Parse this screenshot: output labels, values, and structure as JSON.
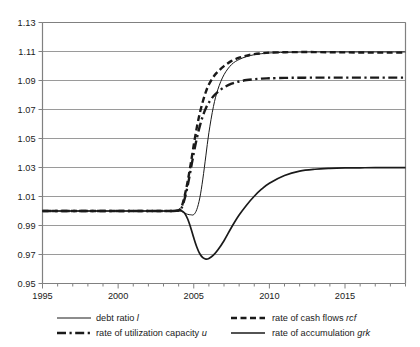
{
  "chart_data": {
    "type": "line",
    "title": "",
    "xlabel": "",
    "ylabel": "",
    "xlim": [
      1995,
      2019
    ],
    "ylim": [
      0.95,
      1.13
    ],
    "grid": "horizontal",
    "legend_position": "bottom",
    "xticks": [
      1995,
      2000,
      2005,
      2010,
      2015
    ],
    "xtick_labels": [
      "1995",
      "2000",
      "2005",
      "2010",
      "2015"
    ],
    "xminor_tick_step": 1,
    "yticks": [
      0.95,
      0.97,
      0.99,
      1.01,
      1.03,
      1.05,
      1.07,
      1.09,
      1.11,
      1.13
    ],
    "ytick_labels": [
      "0.95",
      "0.97",
      "0.99",
      "1.01",
      "1.03",
      "1.05",
      "1.07",
      "1.09",
      "1.11",
      "1.13"
    ],
    "x": [
      1995,
      1996,
      1997,
      1998,
      1999,
      2000,
      2001,
      2002,
      2003,
      2003.5,
      2004,
      2004.2,
      2004.4,
      2004.6,
      2004.8,
      2005,
      2005.2,
      2005.4,
      2005.6,
      2005.8,
      2006,
      2006.3,
      2006.6,
      2007,
      2007.5,
      2008,
      2008.5,
      2009,
      2009.5,
      2010,
      2011,
      2012,
      2013,
      2014,
      2015,
      2016,
      2017,
      2018,
      2019
    ],
    "series": [
      {
        "name": "debt ratio l",
        "symbol": "l",
        "label_prefix": "debt ratio ",
        "style": "solid-thin",
        "color": "#1a1a1a",
        "width": 1.0,
        "dash": "",
        "values": [
          1.0,
          1.0,
          1.0,
          1.0,
          1.0,
          1.0,
          1.0,
          1.0,
          1.0,
          1.0,
          1.0,
          0.9996,
          0.9986,
          0.9977,
          0.9974,
          0.9975,
          1.001,
          1.009,
          1.022,
          1.038,
          1.054,
          1.072,
          1.084,
          1.094,
          1.101,
          1.1045,
          1.1065,
          1.1078,
          1.1085,
          1.109,
          1.1094,
          1.1096,
          1.1097,
          1.1097,
          1.1097,
          1.1097,
          1.1097,
          1.1097,
          1.1097
        ]
      },
      {
        "name": "rate of cash flows rcf",
        "symbol": "rcf",
        "label_prefix": "rate of cash flows ",
        "style": "dashed-thick",
        "color": "#1a1a1a",
        "width": 2.4,
        "dash": "6,3.5",
        "values": [
          1.0,
          1.0,
          1.0,
          1.0,
          1.0,
          1.0,
          1.0,
          1.0,
          1.0,
          1.0,
          1.0005,
          1.003,
          1.0105,
          1.0205,
          1.0325,
          1.0455,
          1.0575,
          1.0675,
          1.0755,
          1.0822,
          1.0872,
          1.0925,
          1.0962,
          1.0999,
          1.1035,
          1.1057,
          1.1072,
          1.1082,
          1.1088,
          1.1092,
          1.1095,
          1.1096,
          1.1096,
          1.1095,
          1.1094,
          1.1093,
          1.1092,
          1.1092,
          1.1092
        ]
      },
      {
        "name": "rate of utilization capacity u",
        "symbol": "u",
        "label_prefix": "rate of utilization capacity ",
        "style": "dashdot-thick",
        "color": "#1a1a1a",
        "width": 2.4,
        "dash": "9,3.5,2.2,3.5",
        "values": [
          1.0,
          1.0,
          1.0,
          1.0,
          1.0,
          1.0,
          1.0,
          1.0,
          1.0,
          1.0,
          1.0003,
          1.0022,
          1.0085,
          1.0175,
          1.0285,
          1.0398,
          1.05,
          1.0585,
          1.0655,
          1.0708,
          1.0748,
          1.0792,
          1.0822,
          1.0852,
          1.0878,
          1.0893,
          1.0903,
          1.0909,
          1.0913,
          1.0915,
          1.0918,
          1.0919,
          1.092,
          1.092,
          1.092,
          1.092,
          1.092,
          1.092,
          1.092
        ]
      },
      {
        "name": "rate of accumulation grk",
        "symbol": "grk",
        "label_prefix": "rate of accumulation ",
        "style": "solid-medium",
        "color": "#1a1a1a",
        "width": 1.7,
        "dash": "",
        "values": [
          1.0,
          1.0,
          1.0,
          1.0,
          1.0,
          1.0,
          1.0,
          1.0,
          1.0,
          1.0,
          1.0005,
          1.0002,
          0.9985,
          0.9945,
          0.9885,
          0.9815,
          0.9752,
          0.9705,
          0.9678,
          0.9668,
          0.9672,
          0.9695,
          0.9732,
          0.9795,
          0.9888,
          0.9972,
          1.0042,
          1.0102,
          1.0152,
          1.0192,
          1.0245,
          1.0275,
          1.0288,
          1.0294,
          1.0297,
          1.0298,
          1.0299,
          1.0299,
          1.0299
        ]
      }
    ]
  },
  "legend": {
    "entries": [
      {
        "label_prefix": "debt ratio ",
        "symbol": "l",
        "style": "solid-thin"
      },
      {
        "label_prefix": "rate of cash flows ",
        "symbol": "rcf",
        "style": "dashed-thick"
      },
      {
        "label_prefix": "rate of utilization capacity ",
        "symbol": "u",
        "style": "dashdot-thick"
      },
      {
        "label_prefix": "rate of accumulation ",
        "symbol": "grk",
        "style": "solid-medium"
      }
    ]
  },
  "style": {
    "axis_color": "#808080",
    "grid_color": "#9a9a9a",
    "text_color": "#1a1a1a",
    "line_color": "#1a1a1a",
    "background": "#ffffff"
  }
}
